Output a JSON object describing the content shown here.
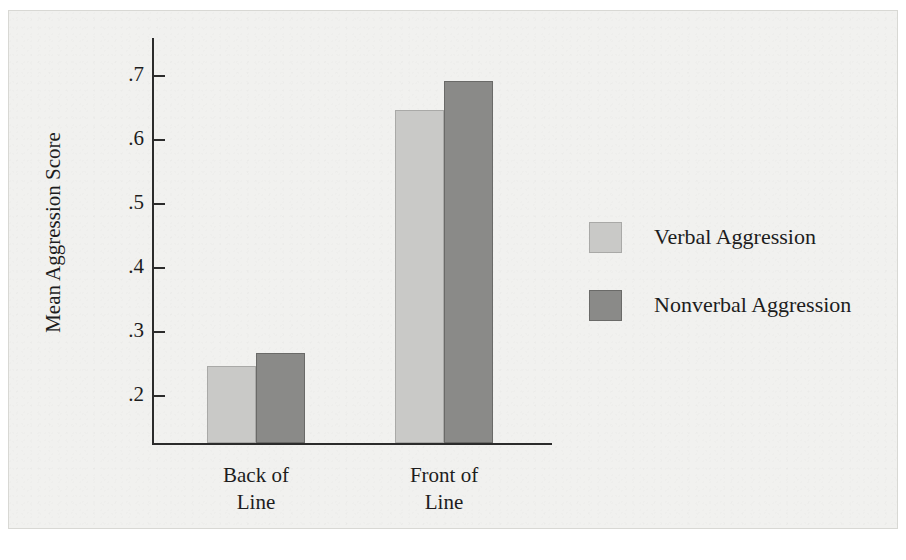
{
  "figure": {
    "background_color": "#f1f1ef",
    "frame_color": "#d8d8d4"
  },
  "chart_data": {
    "type": "bar",
    "title": "",
    "subtitle": "",
    "xlabel": "",
    "ylabel": "Mean Aggression Score",
    "categories": [
      "Back of\nLine",
      "Front of\nLine"
    ],
    "category_labels_flat": [
      "Back of Line",
      "Front of Line"
    ],
    "series": [
      {
        "name": "Verbal Aggression",
        "color": "#c9c9c7",
        "values": [
          0.245,
          0.645
        ]
      },
      {
        "name": "Nonverbal Aggression",
        "color": "#8a8a88",
        "values": [
          0.265,
          0.69
        ]
      }
    ],
    "ylim": [
      0.15,
      0.74
    ],
    "yticks": [
      0.7,
      0.6,
      0.5,
      0.4,
      0.3,
      0.2
    ],
    "ytick_labels": [
      ".7",
      ".6",
      ".5",
      ".4",
      ".3",
      ".2"
    ],
    "grid": false,
    "legend_position": "right",
    "axis_color": "#2b2b2b"
  },
  "legend": {
    "entries": [
      {
        "label": "Verbal Aggression",
        "swatch": "light"
      },
      {
        "label": "Nonverbal Aggression",
        "swatch": "dark"
      }
    ]
  }
}
